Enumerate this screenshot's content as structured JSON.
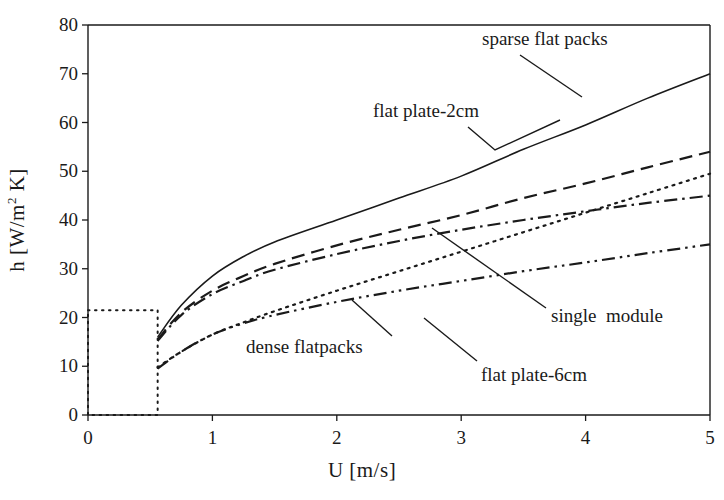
{
  "chart_data": {
    "type": "line",
    "title": "",
    "xlabel": "U [m/s]",
    "ylabel": "h [W/m² K]",
    "xlim": [
      0,
      5
    ],
    "ylim": [
      0,
      80
    ],
    "xticks": [
      0,
      1,
      2,
      3,
      4,
      5
    ],
    "xtick_labels": [
      "0",
      "1",
      "2",
      "3",
      "4",
      "5"
    ],
    "yticks": [
      0,
      10,
      20,
      30,
      40,
      50,
      60,
      70,
      80
    ],
    "ytick_labels": [
      "0",
      "10",
      "20",
      "30",
      "40",
      "50",
      "60",
      "70",
      "80"
    ],
    "grid": false,
    "legend_position": "inline-annotations",
    "series": [
      {
        "name": "sparse flat packs",
        "style": "solid",
        "x": [
          0.56,
          0.75,
          1.0,
          1.25,
          1.5,
          2.0,
          2.5,
          3.0,
          3.5,
          4.0,
          4.5,
          5.0
        ],
        "values": [
          16.0,
          22.5,
          28.5,
          32.5,
          35.5,
          40.0,
          44.5,
          49.0,
          54.5,
          59.5,
          65.0,
          70.0
        ]
      },
      {
        "name": "flat plate-2cm",
        "style": "dashed",
        "x": [
          0.56,
          0.75,
          1.0,
          1.25,
          1.5,
          2.0,
          2.5,
          3.0,
          3.5,
          4.0,
          4.5,
          5.0
        ],
        "values": [
          15.5,
          21.0,
          25.5,
          28.5,
          31.0,
          34.8,
          38.0,
          41.0,
          44.5,
          47.5,
          50.8,
          54.0
        ]
      },
      {
        "name": "single  module",
        "style": "dashdot",
        "x": [
          0.56,
          0.75,
          1.0,
          1.25,
          1.5,
          2.0,
          2.5,
          3.0,
          3.5,
          4.0,
          4.5,
          5.0
        ],
        "values": [
          15.2,
          20.5,
          24.8,
          27.5,
          29.8,
          33.0,
          35.7,
          38.0,
          40.0,
          41.8,
          43.5,
          45.0
        ]
      },
      {
        "name": "dense flatpacks",
        "style": "dotted",
        "x": [
          0.56,
          0.75,
          1.0,
          1.25,
          1.5,
          2.0,
          2.5,
          3.0,
          3.5,
          4.0,
          4.5,
          5.0
        ],
        "values": [
          9.8,
          13.0,
          16.5,
          19.0,
          21.3,
          25.5,
          29.5,
          33.5,
          37.5,
          41.5,
          45.5,
          49.5
        ]
      },
      {
        "name": "flat plate-6cm",
        "style": "dashdotdot",
        "x": [
          0.56,
          0.75,
          1.0,
          1.25,
          1.5,
          2.0,
          2.5,
          3.0,
          3.5,
          4.0,
          4.5,
          5.0
        ],
        "values": [
          9.5,
          13.0,
          16.5,
          18.8,
          20.5,
          23.2,
          25.5,
          27.5,
          29.5,
          31.3,
          33.2,
          35.0
        ]
      }
    ],
    "annotations": [
      {
        "id": "sparse-flat-packs",
        "text": "sparse flat packs",
        "x_px": 482,
        "y_px": 28,
        "leader": [
          [
            520,
            55
          ],
          [
            582,
            97
          ]
        ]
      },
      {
        "id": "flat-plate-2cm",
        "text": "flat plate-2cm",
        "x_px": 373,
        "y_px": 100,
        "leader": [
          [
            468,
            127
          ],
          [
            495,
            150
          ],
          [
            560,
            120
          ]
        ]
      },
      {
        "id": "single-module",
        "text": "single  module",
        "x_px": 551,
        "y_px": 305,
        "leader": [
          [
            546,
            308
          ],
          [
            432,
            228
          ]
        ]
      },
      {
        "id": "dense-flatpacks",
        "text": "dense flatpacks",
        "x_px": 246,
        "y_px": 336,
        "leader": [
          [
            392,
            336
          ],
          [
            352,
            300
          ]
        ]
      },
      {
        "id": "flat-plate-6cm",
        "text": "flat plate-6cm",
        "x_px": 481,
        "y_px": 364,
        "leader": [
          [
            477,
            361
          ],
          [
            424,
            318
          ]
        ]
      }
    ],
    "inset_box": {
      "label": "dotted detail rectangle",
      "x_range": [
        0.0,
        0.56
      ],
      "y_range": [
        0.0,
        21.5
      ]
    },
    "axis_colors": {
      "line": "#1a1a1a",
      "background": "#ffffff"
    }
  }
}
